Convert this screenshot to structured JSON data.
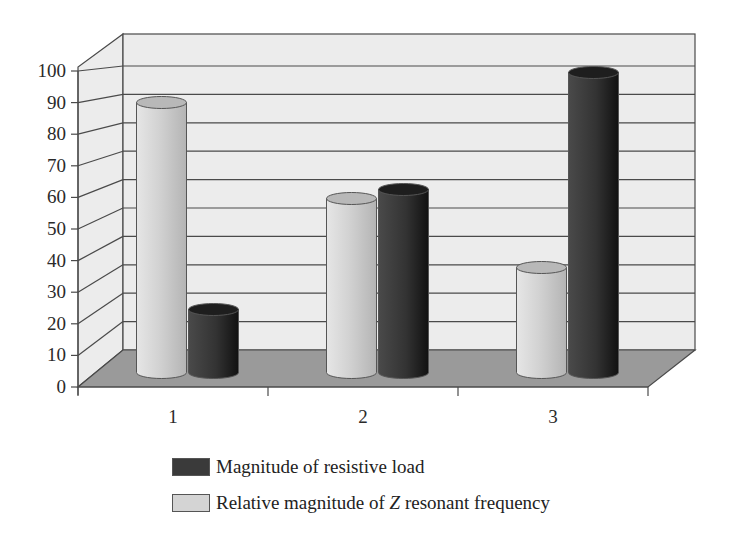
{
  "chart_data": {
    "type": "bar",
    "subtype": "3d-cylinder-clustered",
    "title": "",
    "xlabel": "",
    "ylabel": "",
    "categories": [
      "1",
      "2",
      "3"
    ],
    "series": [
      {
        "name": "Relative magnitude of Z resonant frequency",
        "color": "#d4d4d4",
        "values": [
          90,
          58,
          35
        ]
      },
      {
        "name": "Magnitude of resistive load",
        "color": "#3a3a3a",
        "values": [
          21,
          61,
          100
        ]
      }
    ],
    "ylim": [
      0,
      100
    ],
    "yticks": [
      "0",
      "10",
      "20",
      "30",
      "40",
      "50",
      "60",
      "70",
      "80",
      "90",
      "100"
    ],
    "grid": true,
    "legend_position": "bottom"
  },
  "legend": {
    "items": [
      {
        "label": "Magnitude of resistive load",
        "color": "#3a3a3a"
      },
      {
        "label_prefix": "Relative magnitude of ",
        "label_italic": "Z",
        "label_suffix": " resonant frequency",
        "color": "#d4d4d4"
      }
    ]
  },
  "colors": {
    "wall": "#ececec",
    "floor": "#9a9a9a",
    "grid": "#4a4a4a",
    "light_bar": "#d4d4d4",
    "dark_bar": "#3a3a3a"
  }
}
